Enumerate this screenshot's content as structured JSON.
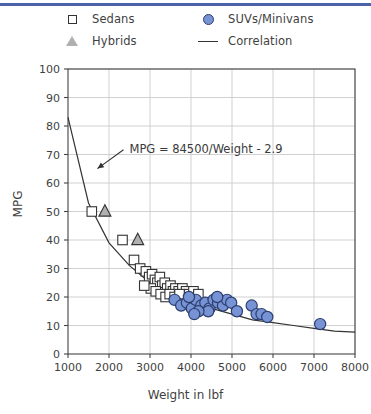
{
  "chart_data": {
    "type": "scatter",
    "title": "",
    "xlabel": "Weight in lbf",
    "ylabel": "MPG",
    "xlim": [
      1000,
      8000
    ],
    "ylim": [
      0,
      100
    ],
    "xticks": [
      1000,
      2000,
      3000,
      4000,
      5000,
      6000,
      7000,
      8000
    ],
    "yticks": [
      0,
      10,
      20,
      30,
      40,
      50,
      60,
      70,
      80,
      90,
      100
    ],
    "grid": true,
    "legend_position": "above-plot",
    "annotations": [
      {
        "text": "MPG = 84500/Weight - 2.9",
        "x": 2500,
        "y": 72,
        "arrow_to_x": 1620,
        "arrow_to_y": 64
      }
    ],
    "series": [
      {
        "name": "Sedans",
        "marker": "square",
        "marker_fill": "#ffffff",
        "marker_edge": "#333333",
        "points": [
          [
            1580,
            50
          ],
          [
            2330,
            40
          ],
          [
            2610,
            33
          ],
          [
            2760,
            30
          ],
          [
            2900,
            29
          ],
          [
            2980,
            27
          ],
          [
            3050,
            28
          ],
          [
            3120,
            26
          ],
          [
            3180,
            25
          ],
          [
            3240,
            27
          ],
          [
            3300,
            24
          ],
          [
            3360,
            25
          ],
          [
            3420,
            23
          ],
          [
            3500,
            24
          ],
          [
            3560,
            22
          ],
          [
            3620,
            23
          ],
          [
            3700,
            22
          ],
          [
            3790,
            23
          ],
          [
            3880,
            22
          ],
          [
            3960,
            21
          ],
          [
            4060,
            22
          ],
          [
            4180,
            21
          ],
          [
            3020,
            23
          ],
          [
            3140,
            22
          ],
          [
            3260,
            21
          ],
          [
            3380,
            20
          ],
          [
            3480,
            21
          ],
          [
            3600,
            20
          ],
          [
            2860,
            24
          ],
          [
            3720,
            21
          ]
        ]
      },
      {
        "name": "Hybrids",
        "marker": "triangle",
        "marker_fill": "#b0b0b0",
        "marker_edge": "#333333",
        "points": [
          [
            1900,
            50
          ],
          [
            2700,
            40
          ]
        ]
      },
      {
        "name": "SUVs/Minivans",
        "marker": "circle",
        "marker_fill": "#7793d4",
        "marker_edge": "#2c3e70",
        "points": [
          [
            3600,
            19
          ],
          [
            3760,
            17
          ],
          [
            3900,
            18
          ],
          [
            4020,
            16
          ],
          [
            4120,
            19
          ],
          [
            4250,
            17
          ],
          [
            4350,
            18
          ],
          [
            4450,
            16
          ],
          [
            4550,
            19
          ],
          [
            4660,
            18
          ],
          [
            4780,
            17
          ],
          [
            4880,
            19
          ],
          [
            4980,
            18
          ],
          [
            5120,
            15
          ],
          [
            4420,
            15
          ],
          [
            4180,
            15
          ],
          [
            5480,
            17
          ],
          [
            5600,
            14
          ],
          [
            5720,
            14
          ],
          [
            5860,
            13
          ],
          [
            7150,
            10.5
          ],
          [
            3950,
            20
          ],
          [
            4640,
            20
          ],
          [
            4080,
            14
          ]
        ]
      },
      {
        "name": "Correlation",
        "marker": "line",
        "line_color": "#333333",
        "formula": "MPG = 84500/Weight - 2.9",
        "points": [
          [
            1000,
            83
          ],
          [
            1500,
            53
          ],
          [
            2000,
            39
          ],
          [
            2500,
            31
          ],
          [
            3000,
            25
          ],
          [
            3500,
            21
          ],
          [
            4000,
            18
          ],
          [
            4500,
            16
          ],
          [
            5000,
            14
          ],
          [
            5500,
            12
          ],
          [
            6000,
            11
          ],
          [
            6500,
            10
          ],
          [
            7000,
            9
          ],
          [
            7500,
            8
          ],
          [
            8000,
            7.7
          ]
        ]
      }
    ]
  },
  "legend": {
    "items": [
      {
        "label": "Sedans",
        "marker": "square-marker"
      },
      {
        "label": "SUVs/Minivans",
        "marker": "circle-marker"
      },
      {
        "label": "Hybrids",
        "marker": "triangle-marker"
      },
      {
        "label": "Correlation",
        "marker": "line-marker"
      }
    ]
  },
  "colors": {
    "top_rule": "#4a62a8",
    "grid": "#cccccc",
    "axis": "#444444",
    "suv_fill": "#7793d4",
    "hybrid_fill": "#b0b0b0"
  }
}
